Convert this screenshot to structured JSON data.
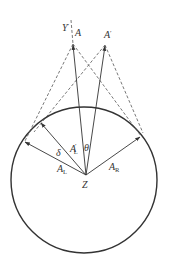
{
  "diagram": {
    "type": "geometric-vector-diagram",
    "colors": {
      "stroke": "#333333",
      "dashed": "#555555",
      "background": "#ffffff"
    },
    "circle": {
      "cx": 84,
      "cy": 180,
      "r": 73
    },
    "origin": {
      "label": "Z",
      "x": 86,
      "y": 175
    },
    "points": {
      "A": {
        "label": "A",
        "x": 73,
        "y": 44
      },
      "A_prime": {
        "label": "A",
        "prime": "′",
        "x": 105,
        "y": 45
      }
    },
    "axis": {
      "label": "Y",
      "prime": "′"
    },
    "vectors": {
      "A_L": {
        "label": "A",
        "sub": "L"
      },
      "A_L_prime": {
        "label": "A",
        "sub": "L",
        "prime": "′"
      },
      "A_R": {
        "label": "A",
        "sub": "R"
      }
    },
    "angles": {
      "delta": "δ",
      "theta": "θ"
    }
  }
}
